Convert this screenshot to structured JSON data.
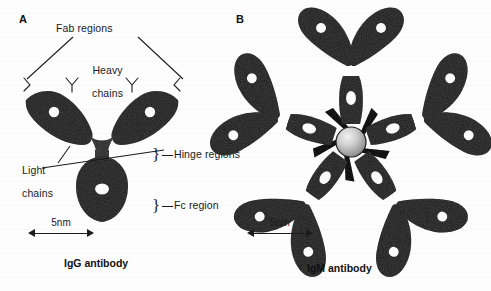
{
  "figure": {
    "background_color": "#fdfdfd",
    "protein_color": "#3f3f3f",
    "ink_color": "#1b1b1b"
  },
  "panels": [
    {
      "letter": "A",
      "caption": "IgG antibody",
      "scale_label": "5nm",
      "labels": [
        {
          "id": "fab-regions",
          "text": "Fab regions"
        },
        {
          "id": "heavy-chains",
          "line1": "Heavy",
          "line2": "chains"
        },
        {
          "id": "light-chains",
          "line1": "Light",
          "line2": "chains"
        },
        {
          "id": "hinge-regions",
          "text": "Hinge regions"
        },
        {
          "id": "fc-region",
          "text": "Fc region"
        }
      ]
    },
    {
      "letter": "B",
      "caption": "IgM antibody",
      "scale_label": "5nm",
      "labels": []
    }
  ]
}
